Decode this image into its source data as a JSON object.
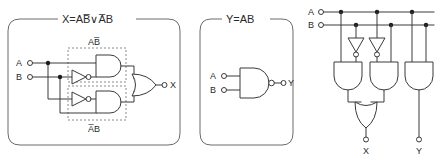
{
  "figure": {
    "type": "logic-circuit-diagram",
    "panel_count": 3,
    "stroke_color": "#3a3a3a",
    "panel_border_color": "#6b6b6b",
    "background": "#ffffff"
  },
  "panels": [
    {
      "id": "panel-xor",
      "title": "X=AB̅∨A̅B",
      "title_plain": "X = A NOT-B OR NOT-A B",
      "inputs": [
        {
          "label": "A"
        },
        {
          "label": "B"
        }
      ],
      "outputs": [
        {
          "label": "X"
        }
      ],
      "group_labels": [
        {
          "label": "AB̅",
          "position": "top"
        },
        {
          "label": "A̅B",
          "position": "bottom"
        }
      ],
      "gates": [
        {
          "kind": "inverter",
          "name": "inverter-b"
        },
        {
          "kind": "and",
          "name": "and-upper"
        },
        {
          "kind": "inverter",
          "name": "inverter-a"
        },
        {
          "kind": "and",
          "name": "and-lower"
        },
        {
          "kind": "or",
          "name": "or-output"
        }
      ]
    },
    {
      "id": "panel-nand",
      "title": "Y=AB",
      "title_plain": "Y = A AND B",
      "inputs": [
        {
          "label": "A"
        },
        {
          "label": "B"
        }
      ],
      "outputs": [
        {
          "label": "Y"
        }
      ],
      "group_labels": [],
      "gates": [
        {
          "kind": "nand",
          "name": "nand-gate"
        }
      ]
    },
    {
      "id": "panel-combined",
      "title": "",
      "title_plain": "",
      "inputs": [
        {
          "label": "A"
        },
        {
          "label": "B"
        }
      ],
      "outputs": [
        {
          "label": "X"
        },
        {
          "label": "Y"
        }
      ],
      "group_labels": [],
      "gates": [
        {
          "kind": "inverter",
          "name": "inverter-left"
        },
        {
          "kind": "inverter",
          "name": "inverter-mid"
        },
        {
          "kind": "and",
          "name": "and-left"
        },
        {
          "kind": "and",
          "name": "and-mid"
        },
        {
          "kind": "and",
          "name": "and-right"
        },
        {
          "kind": "or",
          "name": "or-bottom"
        }
      ]
    }
  ]
}
